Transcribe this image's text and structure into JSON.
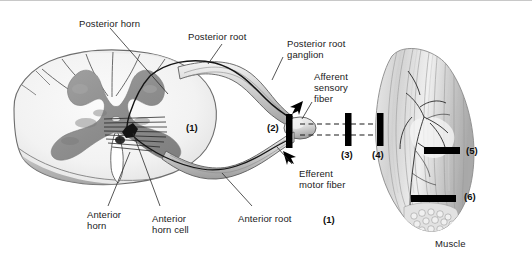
{
  "figure": {
    "background_color": "#ffffff",
    "ink_color": "#1a1a1a",
    "bar_color": "#000000",
    "gray_matter_color": "#8f8f8f",
    "white_matter_color": "#efefef"
  },
  "labels": {
    "posterior_horn": "Posterior horn",
    "posterior_root": "Posterior root",
    "posterior_root_ganglion_line1": "Posterior root",
    "posterior_root_ganglion_line2": "ganglion",
    "afferent_line1": "Afferent",
    "afferent_line2": "sensory",
    "afferent_line3": "fiber",
    "efferent_line1": "Efferent",
    "efferent_line2": "motor fiber",
    "anterior_horn_line1": "Anterior",
    "anterior_horn_line2": "horn",
    "anterior_horn_cell_line1": "Anterior",
    "anterior_horn_cell_line2": "horn cell",
    "anterior_root": "Anterior root",
    "muscle": "Muscle"
  },
  "markers": {
    "m1_cord": "(1)",
    "m2": "(2)",
    "m3": "(3)",
    "m4": "(4)",
    "m5": "(5)",
    "m6": "(6)",
    "m1_root": "(1)"
  },
  "lesion_bars": [
    {
      "id": "(2)",
      "x": 286,
      "y": 115,
      "width": 6,
      "height": 32,
      "note": "at posterior root ganglion / root entry"
    },
    {
      "id": "(3)",
      "x": 346,
      "y": 115,
      "width": 6,
      "height": 30,
      "note": "mid peripheral nerve"
    },
    {
      "id": "(4)",
      "x": 377,
      "y": 115,
      "width": 6,
      "height": 30,
      "note": "distal peripheral nerve at muscle entry"
    },
    {
      "id": "(5)",
      "x": 424,
      "y": 146,
      "width": 36,
      "height": 7,
      "note": "upper muscle belly"
    },
    {
      "id": "(6)",
      "x": 412,
      "y": 194,
      "width": 44,
      "height": 7,
      "note": "lower muscle belly"
    }
  ],
  "arrows": [
    {
      "name": "afferent-direction-arrow",
      "direction": "up-left",
      "x": 297,
      "y": 100
    },
    {
      "name": "efferent-direction-arrow",
      "direction": "down-right",
      "x": 288,
      "y": 148
    }
  ],
  "structures": [
    "spinal cord cross-section",
    "butterfly gray matter",
    "posterior (dorsal) horn",
    "anterior (ventral) horn",
    "anterior horn cell",
    "posterior root",
    "posterior root ganglion",
    "anterior root",
    "peripheral nerve",
    "skeletal muscle"
  ]
}
